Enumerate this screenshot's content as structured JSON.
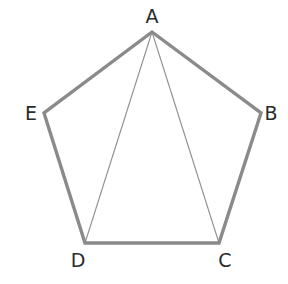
{
  "diagram": {
    "title": "",
    "shape": "pentagon",
    "colors": {
      "edge": "#8a8a8a",
      "diagonal": "#8f8f8f",
      "label": "#2a2a2a",
      "background": "#ffffff"
    },
    "vertices": [
      {
        "name": "A",
        "x": 152,
        "y": 32,
        "label_x": 152,
        "label_y": 16
      },
      {
        "name": "B",
        "x": 261,
        "y": 113,
        "label_x": 271,
        "label_y": 113
      },
      {
        "name": "C",
        "x": 219,
        "y": 243,
        "label_x": 225,
        "label_y": 260
      },
      {
        "name": "D",
        "x": 85,
        "y": 243,
        "label_x": 78,
        "label_y": 260
      },
      {
        "name": "E",
        "x": 44,
        "y": 113,
        "label_x": 31,
        "label_y": 113
      }
    ],
    "edges": [
      "AB",
      "BC",
      "CD",
      "DE",
      "EA"
    ],
    "diagonals": [
      "AD",
      "AC"
    ],
    "labels": {
      "a": "A",
      "b": "B",
      "c": "C",
      "d": "D",
      "e": "E"
    }
  }
}
